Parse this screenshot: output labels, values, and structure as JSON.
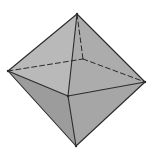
{
  "diagram": {
    "shape": "octahedron",
    "vertices": {
      "top": [
        77,
        14
      ],
      "back": [
        83,
        59
      ],
      "left": [
        8,
        71
      ],
      "front": [
        68,
        96
      ],
      "right": [
        145,
        82
      ],
      "bottom": [
        76,
        146
      ]
    },
    "colors": {
      "background": "#ffffff",
      "edge": "#2a2a2a",
      "face_upper_left": "#b9b9b9",
      "face_upper_right": "#acacac",
      "face_lower_left": "#9c9c9c",
      "face_lower_right": "#a6a6a6"
    },
    "hidden_edges": [
      "top-back",
      "left-back",
      "back-right"
    ],
    "visible_edges": [
      "top-left",
      "top-front",
      "top-right",
      "left-front",
      "front-right",
      "left-bottom",
      "front-bottom",
      "right-bottom"
    ]
  }
}
